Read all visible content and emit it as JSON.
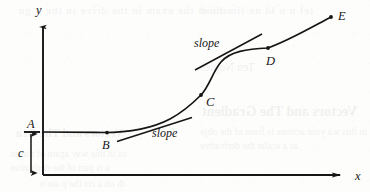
{
  "figure": {
    "type": "math-curve-diagram",
    "ink_color": "#151515",
    "paper_color": "#fdfdfc",
    "axes": {
      "x_label": "x",
      "y_label": "y",
      "origin": {
        "x": 43,
        "y": 175
      },
      "x_axis_end": {
        "x": 348,
        "y": 175
      },
      "y_axis_top": {
        "x": 43,
        "y": 22
      }
    },
    "markers": [
      {
        "id": "A",
        "label": "A",
        "kind": "level-tick",
        "x": 43,
        "y": 132,
        "label_x": 27,
        "label_y": 118,
        "has_dot": false
      },
      {
        "id": "B",
        "label": "B",
        "kind": "curve-point",
        "x": 107,
        "y": 133,
        "label_x": 102,
        "label_y": 139,
        "has_dot": true
      },
      {
        "id": "C",
        "label": "C",
        "kind": "curve-point",
        "x": 201,
        "y": 95,
        "label_x": 206,
        "label_y": 96,
        "has_dot": true
      },
      {
        "id": "D",
        "label": "D",
        "kind": "curve-point",
        "x": 268,
        "y": 48,
        "label_x": 266,
        "label_y": 55,
        "has_dot": true
      },
      {
        "id": "E",
        "label": "E",
        "kind": "curve-point",
        "x": 331,
        "y": 17,
        "label_x": 338,
        "label_y": 10,
        "has_dot": true
      }
    ],
    "offset": {
      "label": "c",
      "label_x": 18,
      "label_y": 147,
      "from_y": 132,
      "to_y": 175,
      "at_x": 31,
      "meaning": "vertical distance from x-axis up to level A"
    },
    "tangents": [
      {
        "id": "tangent-at-B",
        "label": "slope",
        "label_x": 152,
        "label_y": 128,
        "from": {
          "x": 117,
          "y": 141
        },
        "to": {
          "x": 192,
          "y": 118
        }
      },
      {
        "id": "tangent-at-C",
        "label": "slope",
        "label_x": 194,
        "label_y": 38,
        "from": {
          "x": 195,
          "y": 70
        },
        "to": {
          "x": 262,
          "y": 34
        }
      }
    ],
    "curve": {
      "path": "M 43,132 L 96,132.5 C 130,133.5 152,128 172,117 C 186,109 194,102 201,95 C 210,84 214,70 222,61 C 231,51 248,49 268,48 C 290,40 312,27 331,17",
      "stroke_width": 1.6
    }
  }
}
